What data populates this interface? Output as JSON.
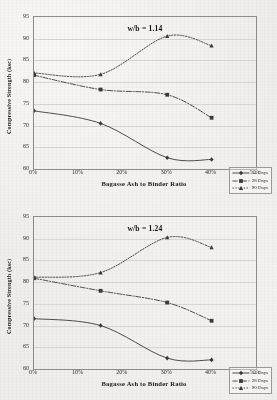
{
  "chart_data": [
    {
      "type": "line",
      "title": "w/b = 1.14",
      "xlabel": "Bagasse Ash to Binder Ratio",
      "ylabel": "Compressive Strength (ksc)",
      "x": [
        0,
        15,
        30,
        40
      ],
      "xtick_labels": [
        "0%",
        "10%",
        "20%",
        "30%",
        "40%",
        "50%"
      ],
      "xtick_values": [
        0,
        10,
        20,
        30,
        40,
        50
      ],
      "xlim": [
        0,
        50
      ],
      "ytick_labels": [
        "60",
        "65",
        "70",
        "75",
        "80",
        "85",
        "90",
        "95"
      ],
      "ytick_values": [
        60,
        65,
        70,
        75,
        80,
        85,
        90,
        95
      ],
      "ylim": [
        60,
        95
      ],
      "grid": "horizontal",
      "legend_position": "lower-right",
      "series": [
        {
          "name": "14 Days",
          "values": [
            73.4,
            70.5,
            62.6,
            62.2
          ],
          "style": "solid",
          "marker": "diamond"
        },
        {
          "name": "28 Days",
          "values": [
            81.6,
            78.3,
            77.1,
            71.8
          ],
          "style": "dash-dot",
          "marker": "square"
        },
        {
          "name": "90 Days",
          "values": [
            82.1,
            81.8,
            90.6,
            88.4
          ],
          "style": "dotted",
          "marker": "triangle"
        }
      ]
    },
    {
      "type": "line",
      "title": "w/b = 1.24",
      "xlabel": "Bagasse Ash to Binder Ratio",
      "ylabel": "Compressive Strength (ksc)",
      "x": [
        0,
        15,
        30,
        40
      ],
      "xtick_labels": [
        "0%",
        "10%",
        "20%",
        "30%",
        "40%",
        "50%"
      ],
      "xtick_values": [
        0,
        10,
        20,
        30,
        40,
        50
      ],
      "xlim": [
        0,
        50
      ],
      "ytick_labels": [
        "60",
        "65",
        "70",
        "75",
        "80",
        "85",
        "90",
        "95"
      ],
      "ytick_values": [
        60,
        65,
        70,
        75,
        80,
        85,
        90,
        95
      ],
      "ylim": [
        60,
        95
      ],
      "grid": "horizontal",
      "legend_position": "lower-right",
      "series": [
        {
          "name": "14 Days",
          "values": [
            71.6,
            70.0,
            62.5,
            62.1
          ],
          "style": "solid",
          "marker": "diamond"
        },
        {
          "name": "28 Days",
          "values": [
            80.9,
            78.0,
            75.3,
            71.1
          ],
          "style": "dash-dot",
          "marker": "square"
        },
        {
          "name": "90 Days",
          "values": [
            81.1,
            82.2,
            90.3,
            88.0
          ],
          "style": "dotted",
          "marker": "triangle"
        }
      ]
    }
  ],
  "colors": {
    "line": "#3a3a3a",
    "grid": "#d8d6d2",
    "axis": "#8e8e8e",
    "background": "#efedea"
  }
}
